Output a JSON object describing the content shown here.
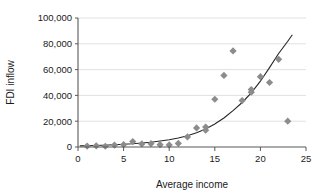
{
  "chart_data": {
    "type": "scatter",
    "title": "",
    "xlabel": "Average income",
    "ylabel": "FDI inflow",
    "xlim": [
      0,
      25
    ],
    "ylim": [
      0,
      100000
    ],
    "xticks": [
      0,
      5,
      10,
      15,
      20,
      25
    ],
    "xtick_labels": [
      "0",
      "5",
      "10",
      "15",
      "20",
      "25"
    ],
    "yticks": [
      0,
      20000,
      40000,
      60000,
      80000,
      100000
    ],
    "ytick_labels": [
      "0",
      "20,000",
      "40,000",
      "60,000",
      "80,000",
      "100,000"
    ],
    "grid": "horizontal",
    "legend": "none",
    "marker": "diamond",
    "marker_color": "#8c8c8c",
    "gridline_color": "#d9d9d9",
    "axis_color": "#595959",
    "trendline_color": "#262626",
    "series": [
      {
        "name": "FDI inflow vs average income",
        "points": [
          {
            "x": 1,
            "y": 700
          },
          {
            "x": 2,
            "y": 900
          },
          {
            "x": 3,
            "y": 600
          },
          {
            "x": 4,
            "y": 1500
          },
          {
            "x": 5,
            "y": 1800
          },
          {
            "x": 6,
            "y": 4200
          },
          {
            "x": 7,
            "y": 2400
          },
          {
            "x": 8,
            "y": 2600
          },
          {
            "x": 9,
            "y": 1800
          },
          {
            "x": 10,
            "y": 1600
          },
          {
            "x": 11,
            "y": 2800
          },
          {
            "x": 12,
            "y": 7800
          },
          {
            "x": 13,
            "y": 14800
          },
          {
            "x": 14,
            "y": 13000
          },
          {
            "x": 14,
            "y": 15500
          },
          {
            "x": 15,
            "y": 37000
          },
          {
            "x": 16,
            "y": 55500
          },
          {
            "x": 17,
            "y": 74500
          },
          {
            "x": 18,
            "y": 36000
          },
          {
            "x": 19,
            "y": 42500
          },
          {
            "x": 19,
            "y": 44500
          },
          {
            "x": 20,
            "y": 54500
          },
          {
            "x": 21,
            "y": 50000
          },
          {
            "x": 22,
            "y": 68000
          },
          {
            "x": 23,
            "y": 20000
          }
        ]
      }
    ],
    "trendline": {
      "type": "exponential",
      "description": "fitted exponential curve rising from near 0 at income 0 to about 87,000 at income 23.5",
      "points": [
        {
          "x": 0.2,
          "y": 900
        },
        {
          "x": 2,
          "y": 1200
        },
        {
          "x": 4,
          "y": 1700
        },
        {
          "x": 6,
          "y": 2500
        },
        {
          "x": 8,
          "y": 3700
        },
        {
          "x": 10,
          "y": 5600
        },
        {
          "x": 11,
          "y": 7000
        },
        {
          "x": 12,
          "y": 8700
        },
        {
          "x": 13,
          "y": 11000
        },
        {
          "x": 14,
          "y": 14000
        },
        {
          "x": 15,
          "y": 17800
        },
        {
          "x": 16,
          "y": 22500
        },
        {
          "x": 17,
          "y": 28200
        },
        {
          "x": 18,
          "y": 34500
        },
        {
          "x": 19,
          "y": 42000
        },
        {
          "x": 20,
          "y": 51000
        },
        {
          "x": 21,
          "y": 61500
        },
        {
          "x": 22,
          "y": 72500
        },
        {
          "x": 23,
          "y": 82000
        },
        {
          "x": 23.5,
          "y": 87000
        }
      ]
    }
  }
}
